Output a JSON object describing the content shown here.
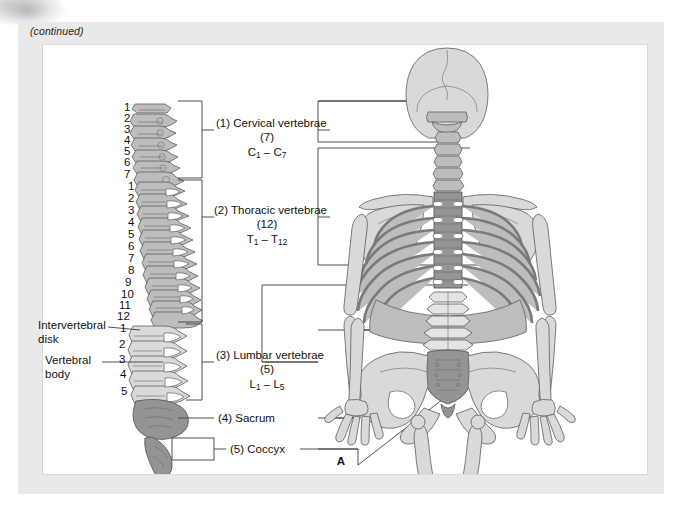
{
  "page": {
    "continued_note": "(continued)",
    "panel_letter": "A"
  },
  "colors": {
    "page_background": "#ffffff",
    "mat": "#e9e9e9",
    "panel": "#ffffff",
    "line": "#3c3c3c",
    "text": "#111111",
    "bone_light": "#d7d7d7",
    "bone_mid": "#b9b9b9",
    "bone_dark": "#8f8f8f",
    "outline": "#5a5a5a"
  },
  "left_labels": [
    {
      "id": "intervertebral-disk",
      "line1": "Intervertebral",
      "line2": "disk"
    },
    {
      "id": "vertebral-body",
      "line1": "Vertebral",
      "line2": "body"
    }
  ],
  "region_labels": [
    {
      "id": "cervical",
      "number": "(1)",
      "name": "Cervical vertebrae",
      "count": "(7)",
      "range_prefix": "C",
      "range_from": "1",
      "range_to": "7",
      "text": "(1) Cervical vertebrae",
      "count_text": "(7)"
    },
    {
      "id": "thoracic",
      "number": "(2)",
      "name": "Thoracic vertebrae",
      "count": "(12)",
      "range_prefix": "T",
      "range_from": "1",
      "range_to": "12",
      "text": "(2) Thoracic vertebrae",
      "count_text": "(12)"
    },
    {
      "id": "lumbar",
      "number": "(3)",
      "name": "Lumbar vertebrae",
      "count": "(5)",
      "range_prefix": "L",
      "range_from": "1",
      "range_to": "5",
      "text": "(3) Lumbar vertebrae",
      "count_text": "(5)"
    },
    {
      "id": "sacrum",
      "number": "(4)",
      "name": "Sacrum",
      "text": "(4) Sacrum"
    },
    {
      "id": "coccyx",
      "number": "(5)",
      "name": "Coccyx",
      "text": "(5) Coccyx"
    }
  ],
  "vertebra_numbers": {
    "cervical": [
      "1",
      "2",
      "3",
      "4",
      "5",
      "6",
      "7"
    ],
    "thoracic": [
      "1",
      "2",
      "3",
      "4",
      "5",
      "6",
      "7",
      "8",
      "9",
      "10",
      "11",
      "12"
    ],
    "lumbar": [
      "1",
      "2",
      "3",
      "4",
      "5"
    ]
  },
  "diagram": {
    "left_view": "lateral-vertebral-column",
    "right_view": "posterior-full-skeleton"
  }
}
